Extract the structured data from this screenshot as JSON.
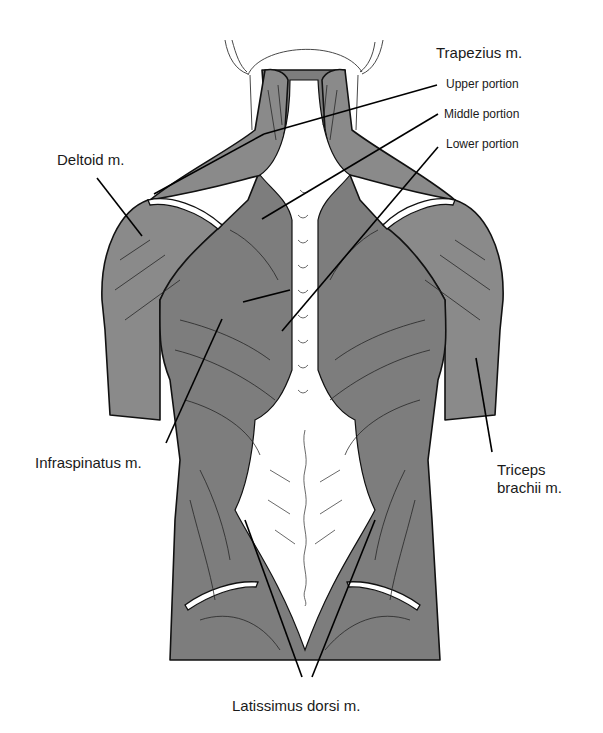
{
  "figure": {
    "colors": {
      "muscle_fill": "#8a8a8a",
      "outline": "#111111",
      "background": "#ffffff",
      "label_text": "#1a1a1a"
    }
  },
  "labels": {
    "trapezius": "Trapezius m.",
    "trapezius_upper": "Upper portion",
    "trapezius_middle": "Middle portion",
    "trapezius_lower": "Lower portion",
    "deltoid": "Deltoid m.",
    "infraspinatus": "Infraspinatus m.",
    "triceps_line1": "Triceps",
    "triceps_line2": "brachii m.",
    "latissimus": "Latissimus dorsi m."
  }
}
